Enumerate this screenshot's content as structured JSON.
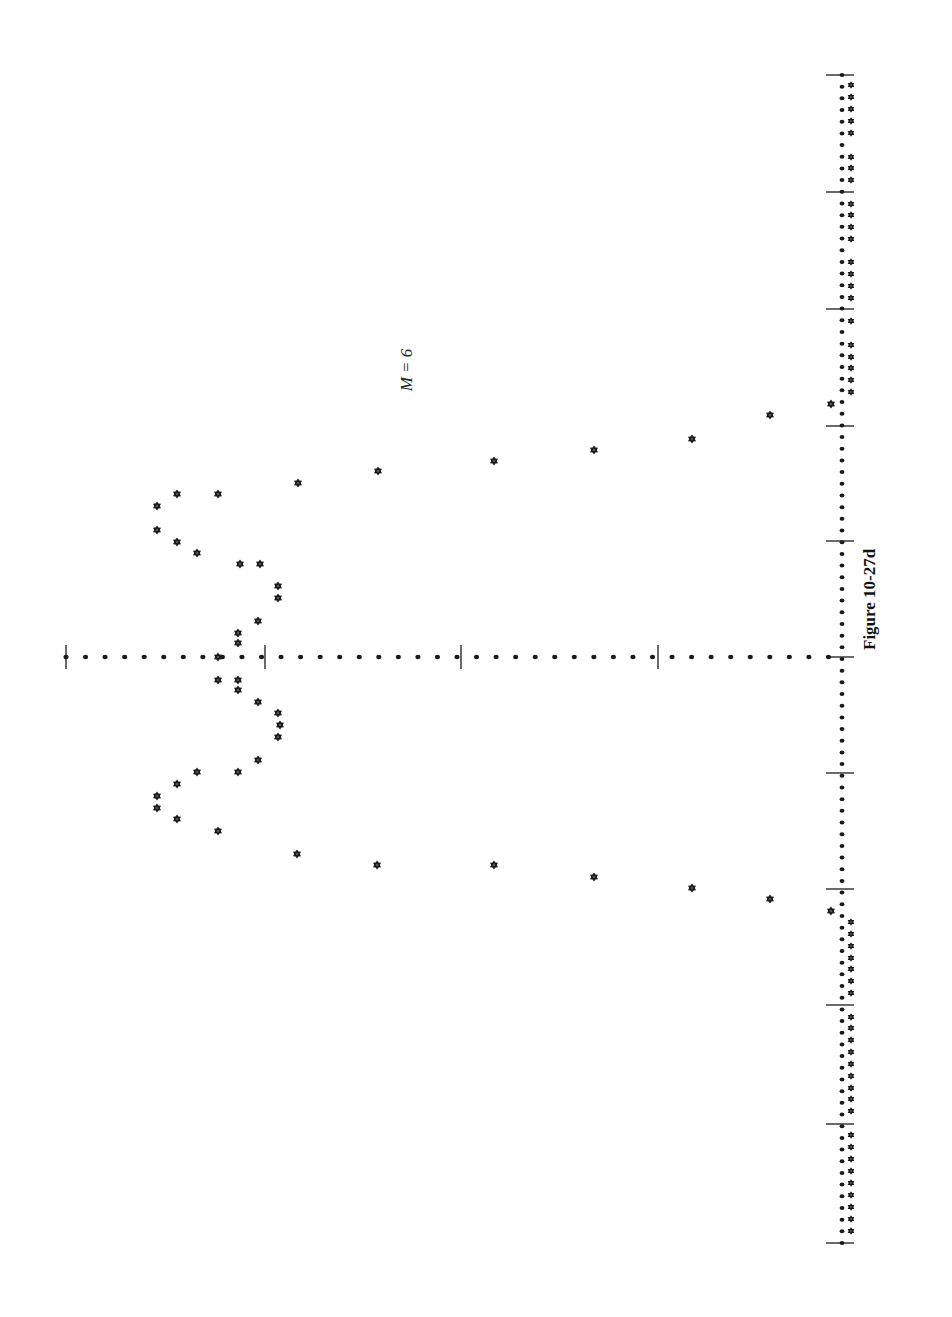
{
  "figure": {
    "caption": "Figure 10-27d",
    "annotation": "M = 6"
  },
  "colors": {
    "ink": "#1a1a1a",
    "background": "#ffffff"
  },
  "layout": {
    "orientation": "rotated-90",
    "freq_axis": {
      "x": 840,
      "y_start": 75,
      "y_end": 1243,
      "ticks_y": [
        75,
        192,
        309,
        426,
        541,
        657,
        773,
        889,
        1005,
        1124,
        1243
      ]
    },
    "mag_axis": {
      "y": 657,
      "x_start": 66,
      "x_end": 840,
      "ticks_x": [
        66,
        265,
        461,
        658
      ]
    }
  },
  "chart_data": {
    "type": "scatter",
    "title": "Figure 10-27d",
    "annotation": "M = 6",
    "xlabel": "",
    "ylabel": "",
    "note": "Plot is printed rotated 90°; frequency axis runs vertically, magnitude increases leftward. Points are given as pixel positions [x, y].",
    "grid": false,
    "legend": null,
    "axis_markers": {
      "vertical_axis_dots_spacing_px": 11.7,
      "horizontal_axis_dots_spacing_px": 19.6
    },
    "points_upper": [
      [
        218,
        657
      ],
      [
        238,
        643
      ],
      [
        238,
        633
      ],
      [
        258,
        621
      ],
      [
        278,
        598
      ],
      [
        278,
        586
      ],
      [
        240,
        564
      ],
      [
        260,
        564
      ],
      [
        197,
        553
      ],
      [
        177,
        542
      ],
      [
        157,
        530
      ],
      [
        157,
        506
      ],
      [
        177,
        494
      ],
      [
        218,
        494
      ],
      [
        298,
        483
      ],
      [
        378,
        471
      ],
      [
        494,
        461
      ],
      [
        594,
        450
      ],
      [
        692,
        439
      ],
      [
        770,
        415
      ],
      [
        831,
        404
      ]
    ],
    "points_lower": [
      [
        218,
        680
      ],
      [
        238,
        680
      ],
      [
        238,
        690
      ],
      [
        258,
        702
      ],
      [
        278,
        713
      ],
      [
        280,
        725
      ],
      [
        278,
        737
      ],
      [
        258,
        760
      ],
      [
        238,
        772
      ],
      [
        197,
        772
      ],
      [
        177,
        784
      ],
      [
        157,
        796
      ],
      [
        157,
        808
      ],
      [
        177,
        819
      ],
      [
        218,
        831
      ],
      [
        297,
        854
      ],
      [
        377,
        865
      ],
      [
        494,
        865
      ],
      [
        594,
        877
      ],
      [
        692,
        888
      ],
      [
        770,
        899
      ],
      [
        831,
        911
      ]
    ],
    "near_axis_points_upper_y": [
      85,
      97,
      109,
      121,
      133,
      157,
      168,
      180,
      204,
      215,
      227,
      239,
      262,
      274,
      286,
      298,
      321,
      345,
      357,
      368,
      380,
      392
    ],
    "near_axis_points_lower_y": [
      922,
      934,
      946,
      958,
      969,
      981,
      993,
      1017,
      1028,
      1040,
      1052,
      1064,
      1076,
      1088,
      1099,
      1111,
      1135,
      1147,
      1159,
      1171,
      1183,
      1195,
      1207,
      1219,
      1231
    ]
  }
}
